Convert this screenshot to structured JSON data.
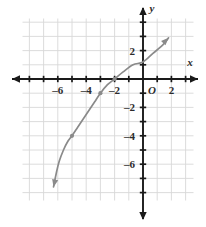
{
  "chart_data": {
    "type": "line",
    "title": "",
    "xlabel": "x",
    "ylabel": "y",
    "grid": true,
    "legend": false,
    "xlim": [
      -8.6,
      3.9
    ],
    "ylim": [
      -8.3,
      4.4
    ],
    "x_ticks": [
      -6,
      -4,
      -2,
      2
    ],
    "y_ticks": [
      2,
      -2,
      -4,
      -6
    ],
    "x_tick_labels": [
      "–6",
      "–4",
      "–2",
      "2"
    ],
    "y_tick_labels": [
      "2",
      "–2",
      "–4",
      "–6"
    ],
    "origin_label": "O",
    "curve_color": "#8a8a8a",
    "axis_color": "#1a1a1a",
    "grid_color": "#d8d8d8",
    "point_color": "#8a8a8a",
    "series": [
      {
        "name": "curve",
        "points": [
          [
            -6.3,
            -7.6
          ],
          [
            -6.1,
            -6.6
          ],
          [
            -5.9,
            -5.8
          ],
          [
            -5.6,
            -5.0
          ],
          [
            -5.3,
            -4.4
          ],
          [
            -5.0,
            -4.0
          ],
          [
            -4.6,
            -3.4
          ],
          [
            -4.2,
            -2.8
          ],
          [
            -3.8,
            -2.2
          ],
          [
            -3.4,
            -1.6
          ],
          [
            -3.0,
            -1.0
          ],
          [
            -2.5,
            -0.4
          ],
          [
            -2.0,
            0.0
          ],
          [
            -1.4,
            0.5
          ],
          [
            -0.7,
            1.0
          ],
          [
            0.0,
            1.2
          ],
          [
            0.7,
            1.8
          ],
          [
            1.4,
            2.4
          ],
          [
            1.8,
            2.9
          ]
        ]
      }
    ],
    "marked_points": [
      {
        "x": -5.0,
        "y": -4.0
      },
      {
        "x": -3.0,
        "y": -1.0
      },
      {
        "x": -2.0,
        "y": 0.0
      }
    ],
    "curve_arrow_start": "down-left",
    "curve_arrow_end": "up-right",
    "annotations": []
  }
}
